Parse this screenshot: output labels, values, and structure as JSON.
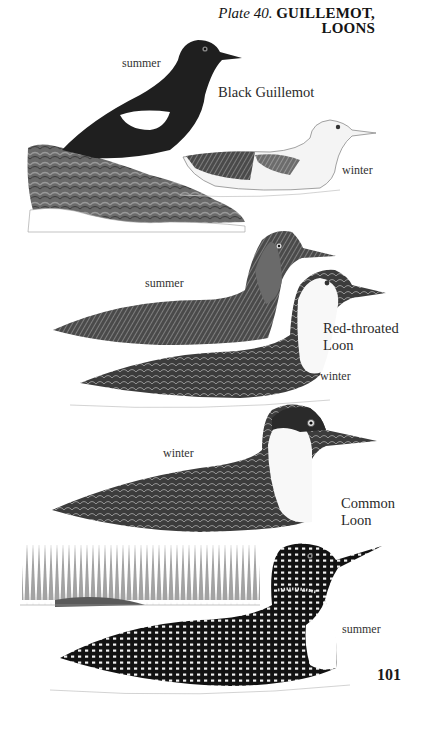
{
  "header": {
    "plate_number": "Plate 40.",
    "plate_title_line1": "GUILLEMOT,",
    "plate_title_line2": "LOONS"
  },
  "plates": [
    {
      "species": "Black Guillemot",
      "species_lines": [
        "Black Guillemot"
      ],
      "plumages": [
        {
          "label": "summer",
          "illustration": "black-guillemot-summer-on-rock"
        },
        {
          "label": "winter",
          "illustration": "black-guillemot-winter-swimming"
        }
      ]
    },
    {
      "species": "Red-throated Loon",
      "species_lines": [
        "Red-throated",
        "Loon"
      ],
      "plumages": [
        {
          "label": "summer",
          "illustration": "red-throated-loon-summer-swimming"
        },
        {
          "label": "winter",
          "illustration": "red-throated-loon-winter-swimming"
        }
      ]
    },
    {
      "species": "Common Loon",
      "species_lines": [
        "Common",
        "Loon"
      ],
      "plumages": [
        {
          "label": "winter",
          "illustration": "common-loon-winter-swimming"
        },
        {
          "label": "summer",
          "illustration": "common-loon-summer-swimming-lake-background"
        }
      ]
    }
  ],
  "footer": {
    "page_number": "101"
  },
  "colors": {
    "ink_dark": "#1c1c1c",
    "ink_mid": "#5a5a5a",
    "ink_light": "#bdbdbd",
    "paper": "#ffffff"
  }
}
